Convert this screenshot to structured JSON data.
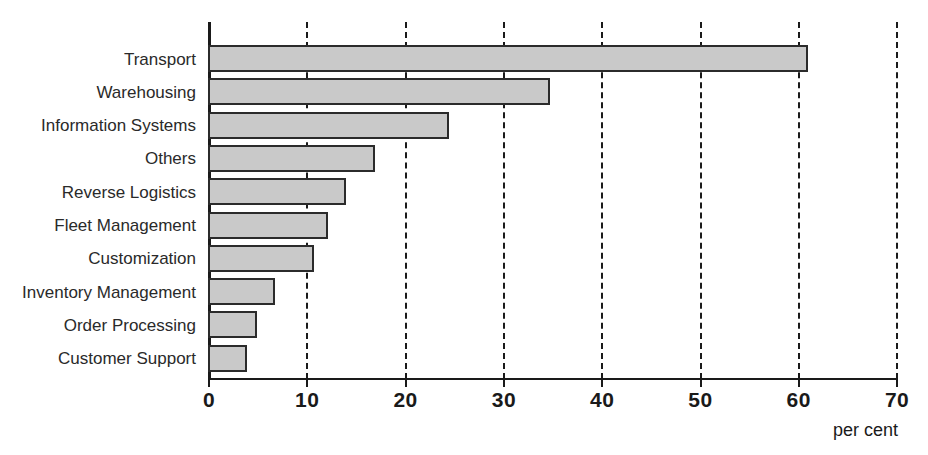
{
  "chart_data": {
    "type": "bar",
    "orientation": "horizontal",
    "title": "",
    "subtitle": "",
    "xlabel": "per cent",
    "ylabel": "",
    "categories": [
      "Transport",
      "Warehousing",
      "Information Systems",
      "Others",
      "Reverse Logistics",
      "Fleet Management",
      "Customization",
      "Inventory Management",
      "Order Processing",
      "Customer Support"
    ],
    "values": [
      61,
      34.8,
      24.5,
      17,
      14,
      12.2,
      10.8,
      6.8,
      5,
      4
    ],
    "xlim": [
      0,
      70
    ],
    "xticks": [
      0,
      10,
      20,
      30,
      40,
      50,
      60,
      70
    ],
    "xtick_labels": [
      "0",
      "10",
      "20",
      "30",
      "40",
      "50",
      "60",
      "70"
    ],
    "grid": "vertical-dashed",
    "legend": "none",
    "bar_fill": "#c9c9c9",
    "bar_border": "#2b2b2b",
    "axis_color": "#1a1a1a",
    "background": "#ffffff"
  },
  "axis_caption": "per cent"
}
